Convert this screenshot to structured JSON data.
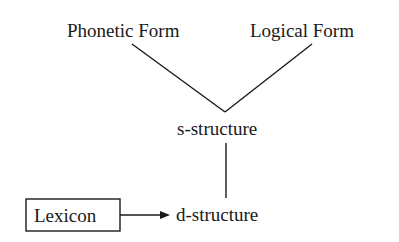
{
  "diagram": {
    "type": "model-of-grammar",
    "nodes": {
      "phonetic_form": {
        "label": "Phonetic Form"
      },
      "logical_form": {
        "label": "Logical Form"
      },
      "s_structure": {
        "label": "s-structure"
      },
      "d_structure": {
        "label": "d-structure"
      },
      "lexicon": {
        "label": "Lexicon",
        "boxed": true
      }
    },
    "edges": [
      {
        "from": "s_structure",
        "to": "phonetic_form",
        "style": "line"
      },
      {
        "from": "s_structure",
        "to": "logical_form",
        "style": "line"
      },
      {
        "from": "d_structure",
        "to": "s_structure",
        "style": "line"
      },
      {
        "from": "lexicon",
        "to": "d_structure",
        "style": "arrow"
      }
    ],
    "colors": {
      "ink": "#1a1a1a",
      "background": "#ffffff"
    }
  }
}
